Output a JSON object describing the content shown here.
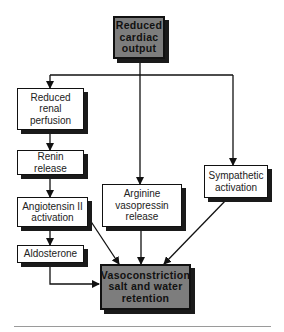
{
  "diagram": {
    "type": "flowchart",
    "nodes": [
      {
        "id": "reduced_cardiac_output",
        "label": "Reduced\ncardiac\noutput",
        "style": "dark"
      },
      {
        "id": "reduced_renal_perfusion",
        "label": "Reduced\nrenal\nperfusion",
        "style": "light"
      },
      {
        "id": "renin_release",
        "label": "Renin\nrelease",
        "style": "light"
      },
      {
        "id": "angiotensin_ii_activation",
        "label": "Angiotensin II\nactivation",
        "style": "light"
      },
      {
        "id": "aldosterone",
        "label": "Aldosterone",
        "style": "light"
      },
      {
        "id": "arginine_vasopressin_release",
        "label": "Arginine\nvasopressin\nrelease",
        "style": "light"
      },
      {
        "id": "sympathetic_activation",
        "label": "Sympathetic\nactivation",
        "style": "light"
      },
      {
        "id": "vasoconstriction",
        "label": "Vasoconstriction\nsalt and water\nretention",
        "style": "dark"
      }
    ],
    "edges": [
      {
        "from": "reduced_cardiac_output",
        "to": "reduced_renal_perfusion"
      },
      {
        "from": "reduced_cardiac_output",
        "to": "arginine_vasopressin_release"
      },
      {
        "from": "reduced_cardiac_output",
        "to": "sympathetic_activation"
      },
      {
        "from": "reduced_renal_perfusion",
        "to": "renin_release"
      },
      {
        "from": "renin_release",
        "to": "angiotensin_ii_activation"
      },
      {
        "from": "angiotensin_ii_activation",
        "to": "aldosterone"
      },
      {
        "from": "angiotensin_ii_activation",
        "to": "vasoconstriction"
      },
      {
        "from": "aldosterone",
        "to": "vasoconstriction"
      },
      {
        "from": "arginine_vasopressin_release",
        "to": "vasoconstriction"
      },
      {
        "from": "sympathetic_activation",
        "to": "vasoconstriction"
      }
    ],
    "colors": {
      "dark_box_fill": "#7d7d7d",
      "light_box_fill": "#ffffff",
      "line": "#111111",
      "shadow": "#1a1a1a"
    }
  }
}
